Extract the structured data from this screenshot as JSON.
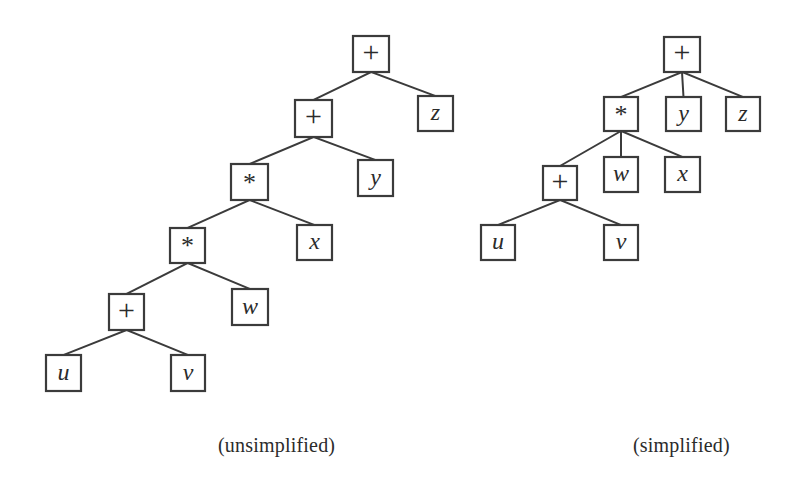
{
  "figure": {
    "background_color": "#ffffff",
    "ink_color": "#3b3b3b",
    "width": 797,
    "height": 488
  },
  "captions": {
    "left": "(unsimplified)",
    "right": "(simplified)"
  },
  "trees": [
    {
      "id": "unsimplified-tree",
      "caption": "(unsimplified)",
      "expression": "((((u + v) * w) * x) + y) + z",
      "description": "Strictly binary expression tree; each operator node has exactly two children.",
      "nodes": [
        {
          "id": "L-plus-root",
          "label": "+",
          "kind": "operator",
          "x": 353,
          "y": 36,
          "w": 36,
          "h": 36
        },
        {
          "id": "L-z",
          "label": "z",
          "kind": "variable",
          "x": 418,
          "y": 96,
          "w": 35,
          "h": 35
        },
        {
          "id": "L-plus-2",
          "label": "+",
          "kind": "operator",
          "x": 295,
          "y": 100,
          "w": 37,
          "h": 37
        },
        {
          "id": "L-y",
          "label": "y",
          "kind": "variable",
          "x": 358,
          "y": 160,
          "w": 35,
          "h": 36
        },
        {
          "id": "L-star-1",
          "label": "*",
          "kind": "operator",
          "x": 231,
          "y": 164,
          "w": 37,
          "h": 36
        },
        {
          "id": "L-x",
          "label": "x",
          "kind": "variable",
          "x": 297,
          "y": 225,
          "w": 35,
          "h": 35
        },
        {
          "id": "L-star-2",
          "label": "*",
          "kind": "operator",
          "x": 170,
          "y": 228,
          "w": 35,
          "h": 35
        },
        {
          "id": "L-w",
          "label": "w",
          "kind": "variable",
          "x": 232,
          "y": 289,
          "w": 36,
          "h": 36
        },
        {
          "id": "L-plus-3",
          "label": "+",
          "kind": "operator",
          "x": 109,
          "y": 294,
          "w": 35,
          "h": 36
        },
        {
          "id": "L-u",
          "label": "u",
          "kind": "variable",
          "x": 46,
          "y": 355,
          "w": 35,
          "h": 36
        },
        {
          "id": "L-v",
          "label": "v",
          "kind": "variable",
          "x": 171,
          "y": 355,
          "w": 34,
          "h": 36
        }
      ],
      "edges": [
        {
          "from": "L-plus-root",
          "to": "L-plus-2"
        },
        {
          "from": "L-plus-root",
          "to": "L-z"
        },
        {
          "from": "L-plus-2",
          "to": "L-star-1"
        },
        {
          "from": "L-plus-2",
          "to": "L-y"
        },
        {
          "from": "L-star-1",
          "to": "L-star-2"
        },
        {
          "from": "L-star-1",
          "to": "L-x"
        },
        {
          "from": "L-star-2",
          "to": "L-plus-3"
        },
        {
          "from": "L-star-2",
          "to": "L-w"
        },
        {
          "from": "L-plus-3",
          "to": "L-u"
        },
        {
          "from": "L-plus-3",
          "to": "L-v"
        }
      ]
    },
    {
      "id": "simplified-tree",
      "caption": "(simplified)",
      "expression": "+( *( +(u, v), w, x ), y, z )",
      "description": "Flattened n-ary expression tree; associative operators collapse into single multi-child nodes.",
      "nodes": [
        {
          "id": "R-plus-root",
          "label": "+",
          "kind": "operator",
          "x": 664,
          "y": 37,
          "w": 36,
          "h": 35
        },
        {
          "id": "R-star",
          "label": "*",
          "kind": "operator",
          "x": 604,
          "y": 97,
          "w": 34,
          "h": 34
        },
        {
          "id": "R-y",
          "label": "y",
          "kind": "variable",
          "x": 666,
          "y": 97,
          "w": 35,
          "h": 34
        },
        {
          "id": "R-z",
          "label": "z",
          "kind": "variable",
          "x": 726,
          "y": 97,
          "w": 34,
          "h": 34
        },
        {
          "id": "R-plus-2",
          "label": "+",
          "kind": "operator",
          "x": 543,
          "y": 166,
          "w": 34,
          "h": 34
        },
        {
          "id": "R-w",
          "label": "w",
          "kind": "variable",
          "x": 604,
          "y": 157,
          "w": 34,
          "h": 35
        },
        {
          "id": "R-x",
          "label": "x",
          "kind": "variable",
          "x": 665,
          "y": 157,
          "w": 35,
          "h": 35
        },
        {
          "id": "R-u",
          "label": "u",
          "kind": "variable",
          "x": 481,
          "y": 225,
          "w": 34,
          "h": 35
        },
        {
          "id": "R-v",
          "label": "v",
          "kind": "variable",
          "x": 604,
          "y": 225,
          "w": 34,
          "h": 35
        }
      ],
      "edges": [
        {
          "from": "R-plus-root",
          "to": "R-star"
        },
        {
          "from": "R-plus-root",
          "to": "R-y"
        },
        {
          "from": "R-plus-root",
          "to": "R-z"
        },
        {
          "from": "R-star",
          "to": "R-plus-2"
        },
        {
          "from": "R-star",
          "to": "R-w"
        },
        {
          "from": "R-star",
          "to": "R-x"
        },
        {
          "from": "R-plus-2",
          "to": "R-u"
        },
        {
          "from": "R-plus-2",
          "to": "R-v"
        }
      ]
    }
  ]
}
